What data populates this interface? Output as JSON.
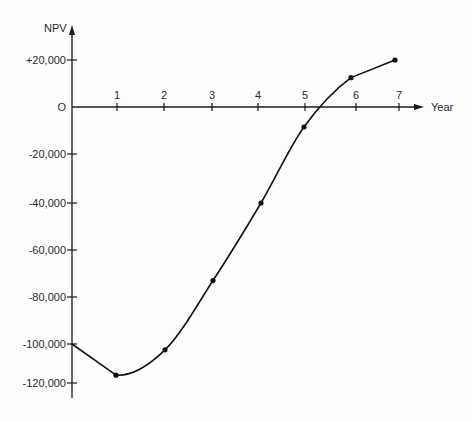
{
  "chart_data": {
    "type": "line",
    "title": "",
    "xlabel": "Year",
    "ylabel": "NPV",
    "x": [
      0,
      1,
      2,
      3,
      4,
      5,
      6,
      7
    ],
    "series": [
      {
        "name": "NPV",
        "values": [
          -100000,
          -116000,
          -103000,
          -73000,
          -40000,
          -8500,
          12500,
          20000
        ],
        "markers": [
          false,
          true,
          true,
          true,
          true,
          true,
          true,
          true
        ]
      }
    ],
    "zero_crossing_year": 5.3,
    "x_tick_labels": [
      "1",
      "2",
      "3",
      "4",
      "5",
      "6",
      "7"
    ],
    "y_tick_labels": [
      "+20,000",
      "O",
      "-20,000",
      "-40,000",
      "-60,000",
      "-80,000",
      "-100,000",
      "-120,000"
    ],
    "y_tick_values": [
      20000,
      0,
      -20000,
      -40000,
      -60000,
      -80000,
      -100000,
      -120000
    ],
    "xlim": [
      0,
      7.5
    ],
    "ylim": [
      -125000,
      30000
    ],
    "grid": false,
    "legend": "none"
  },
  "labels": {
    "y_axis": "NPV",
    "x_axis": "Year",
    "y_ticks": [
      "+20,000",
      "O",
      "-20,000",
      "-40,000",
      "-60,000",
      "-80,000",
      "-100,000",
      "-120,000"
    ],
    "x_ticks": [
      "1",
      "2",
      "3",
      "4",
      "5",
      "6",
      "7"
    ]
  },
  "colors": {
    "line": "#111111",
    "axis": "#1a1a1a",
    "text": "#2a2a2a",
    "background": "#fdfdfd"
  }
}
